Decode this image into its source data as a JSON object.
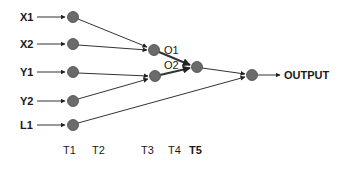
{
  "diagram": {
    "inputs": [
      {
        "label": "X1"
      },
      {
        "label": "X2"
      },
      {
        "label": "Y1"
      },
      {
        "label": "Y2"
      },
      {
        "label": "L1"
      }
    ],
    "hidden": [
      {
        "label": "O1"
      },
      {
        "label": "O2"
      }
    ],
    "output_label": "OUTPUT",
    "time_steps": [
      "T1",
      "T2",
      "T3",
      "T4",
      "T5"
    ],
    "colors": {
      "node_fill": "#6b6b6b",
      "edge": "#333333",
      "text": "#1a1a1a"
    }
  }
}
